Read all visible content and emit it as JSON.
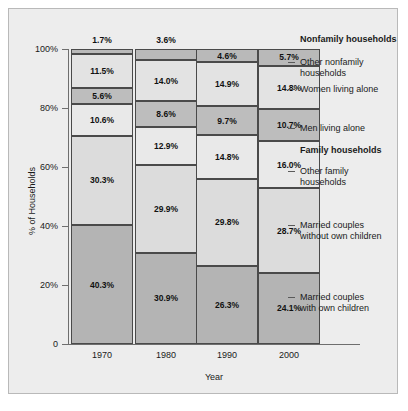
{
  "chart_data": {
    "type": "bar",
    "title": "",
    "xlabel": "Year",
    "ylabel": "% of Households",
    "categories": [
      "1970",
      "1980",
      "1990",
      "2000"
    ],
    "ylim": [
      0,
      100
    ],
    "ytick_labels": [
      "0",
      "20%",
      "40%",
      "60%",
      "80%",
      "100%"
    ],
    "ytick_values": [
      0,
      20,
      40,
      60,
      80,
      100
    ],
    "grid": false,
    "legend_position": "right",
    "stacked": true,
    "series": [
      {
        "name": "Married couples with own children",
        "group": "Family households",
        "color": "#b4b4b4",
        "values": [
          40.3,
          30.9,
          26.3,
          24.1
        ],
        "labels": [
          "40.3%",
          "30.9%",
          "26.3%",
          "24.1%"
        ]
      },
      {
        "name": "Married couples without own children",
        "group": "Family households",
        "color": "#dcdcdc",
        "values": [
          30.3,
          29.9,
          29.8,
          28.7
        ],
        "labels": [
          "30.3%",
          "29.9%",
          "29.8%",
          "28.7%"
        ]
      },
      {
        "name": "Other family households",
        "group": "Family households",
        "color": "#e9e9e9",
        "values": [
          10.6,
          12.9,
          14.8,
          16.0
        ],
        "labels": [
          "10.6%",
          "12.9%",
          "14.8%",
          "16.0%"
        ]
      },
      {
        "name": "Men living alone",
        "group": "Nonfamily households",
        "color": "#bdbdbd",
        "values": [
          5.6,
          8.6,
          9.7,
          10.7
        ],
        "labels": [
          "5.6%",
          "8.6%",
          "9.7%",
          "10.7%"
        ]
      },
      {
        "name": "Women living alone",
        "group": "Nonfamily households",
        "color": "#e3e3e3",
        "values": [
          11.5,
          14.0,
          14.9,
          14.8
        ],
        "labels": [
          "11.5%",
          "14.0%",
          "14.9%",
          "14.8%"
        ]
      },
      {
        "name": "Other nonfamily households",
        "group": "Nonfamily households",
        "color": "#b9b9b9",
        "values": [
          1.7,
          3.6,
          4.6,
          5.7
        ],
        "labels": [
          "1.7%",
          "3.6%",
          "4.6%",
          "5.7%"
        ]
      }
    ],
    "legend_entries": [
      {
        "text": "Nonfamily households",
        "heading": true
      },
      {
        "text": "Other nonfamily\nhouseholds",
        "heading": false
      },
      {
        "text": "Women living alone",
        "heading": false
      },
      {
        "text": "Men living alone",
        "heading": false
      },
      {
        "text": "Family households",
        "heading": true
      },
      {
        "text": "Other family\nhouseholds",
        "heading": false
      },
      {
        "text": "Married couples\nwithout own children",
        "heading": false
      },
      {
        "text": "Married couples\nwith own children",
        "heading": false
      }
    ]
  }
}
